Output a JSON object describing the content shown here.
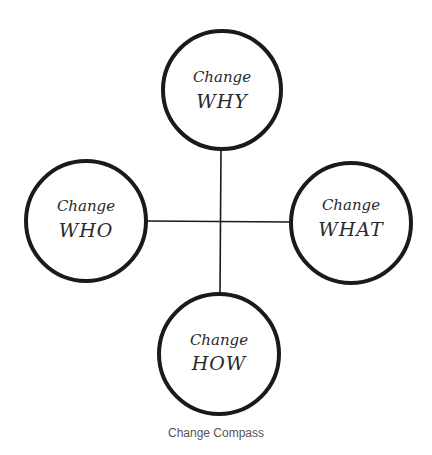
{
  "diagram": {
    "title": "Change Compass",
    "colors": {
      "stroke": "#1a1a1a",
      "text": "#2a2a2a",
      "caption": "#555555",
      "background": "#ffffff"
    },
    "nodes": [
      {
        "id": "why",
        "position": "top",
        "line1": "Change",
        "line2": "WHY",
        "cx": 222,
        "cy": 90,
        "r": 60
      },
      {
        "id": "who",
        "position": "left",
        "line1": "Change",
        "line2": "WHO",
        "cx": 86,
        "cy": 221,
        "r": 61
      },
      {
        "id": "what",
        "position": "right",
        "line1": "Change",
        "line2": "WHAT",
        "cx": 351,
        "cy": 223,
        "r": 61
      },
      {
        "id": "how",
        "position": "bottom",
        "line1": "Change",
        "line2": "HOW",
        "cx": 219,
        "cy": 354,
        "r": 61
      }
    ],
    "edges": [
      {
        "from": "why",
        "to": "how",
        "orientation": "vertical"
      },
      {
        "from": "who",
        "to": "what",
        "orientation": "horizontal"
      }
    ],
    "caption": "Change Compass"
  }
}
